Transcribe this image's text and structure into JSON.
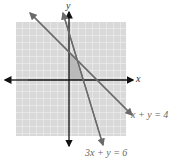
{
  "figure": {
    "axes": {
      "x_label": "x",
      "y_label": "y"
    },
    "lines": [
      {
        "equation": "x + y = 4",
        "label": "x + y = 4"
      },
      {
        "equation": "3x + y = 6",
        "label": "3x + y = 6"
      }
    ],
    "shaded_region": "feasible region x ≥ 0, y ≥ 0, x + y ≤ 4, 3x + y ≤ 6",
    "grid": {
      "x_range": [
        -8,
        8
      ],
      "y_range": [
        -8,
        8
      ]
    },
    "colors": {
      "grid_bg": "#d9d9d9",
      "grid_line": "#f2f2f2",
      "region": "#b0b0b0",
      "line": "#6a6a6a",
      "axis": "#111111"
    }
  }
}
